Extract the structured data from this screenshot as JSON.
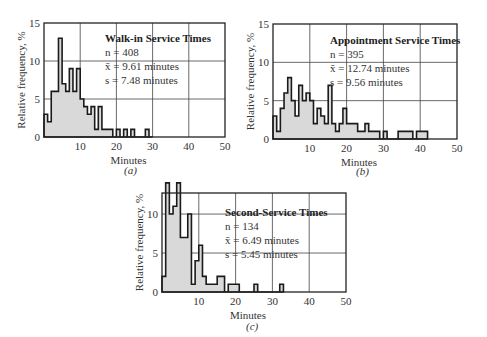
{
  "chart_data": [
    {
      "id": "a",
      "type": "bar",
      "subtype": "histogram",
      "caption": "(a)",
      "title": "Walk-in Service Times",
      "stats": {
        "n_label": "n = 408",
        "mean_label": "x̄ = 9.61 minutes",
        "sd_label": "s = 7.48 minutes"
      },
      "xlabel": "Minutes",
      "ylabel": "Relative frequency, %",
      "xlim": [
        0,
        50
      ],
      "ylim": [
        0,
        15
      ],
      "xticks": [
        10,
        20,
        30,
        40,
        50
      ],
      "yticks": [
        0,
        5,
        10,
        15
      ],
      "grid": true,
      "bin_width": 1,
      "values": [
        3,
        2,
        6,
        6,
        13,
        7,
        6,
        9,
        6,
        9,
        5,
        4,
        3,
        4,
        1,
        4,
        1,
        1,
        1,
        0,
        1,
        0,
        1,
        0,
        1,
        0,
        0,
        0,
        1,
        0
      ]
    },
    {
      "id": "b",
      "type": "bar",
      "subtype": "histogram",
      "caption": "(b)",
      "title": "Appointment Service Times",
      "stats": {
        "n_label": "n = 395",
        "mean_label": "x̄ = 12.74 minutes",
        "sd_label": "s = 9.56 minutes"
      },
      "xlabel": "Minutes",
      "ylabel": "Relative frequency, %",
      "xlim": [
        0,
        50
      ],
      "ylim": [
        0,
        15
      ],
      "xticks": [
        10,
        20,
        30,
        40,
        50
      ],
      "yticks": [
        0,
        5,
        10,
        15
      ],
      "grid": true,
      "bin_width": 1,
      "values": [
        3,
        1,
        4,
        6,
        8,
        5,
        3,
        7,
        5,
        6,
        5,
        2,
        4,
        3,
        2,
        7,
        2,
        1,
        2,
        4,
        2,
        2,
        2,
        1,
        1,
        2,
        1,
        1,
        1,
        0,
        1,
        0,
        0,
        0,
        1,
        1,
        1,
        1,
        0,
        1,
        1,
        1
      ]
    },
    {
      "id": "c",
      "type": "bar",
      "subtype": "histogram",
      "caption": "(c)",
      "title": "Second-Service Times",
      "stats": {
        "n_label": "n = 134",
        "mean_label": "x̄ = 6.49 minutes",
        "sd_label": "s = 5.45 minutes"
      },
      "xlabel": "Minutes",
      "ylabel": "Relative frequency, %",
      "xlim": [
        0,
        50
      ],
      "ylim": [
        0,
        12.7
      ],
      "xticks": [
        10,
        20,
        30,
        40,
        50
      ],
      "yticks": [
        0,
        5,
        10
      ],
      "grid": true,
      "bin_width": 1,
      "values": [
        2,
        14,
        10,
        11,
        14,
        7,
        7,
        10,
        1,
        4,
        6,
        2,
        1,
        1,
        1,
        2,
        2,
        0,
        1,
        1,
        1,
        0,
        0,
        0,
        0,
        1,
        0,
        0,
        0,
        0,
        0,
        0,
        1
      ]
    }
  ],
  "colors": {
    "fill": "#d9d9d9",
    "line": "#1a1a1a",
    "grid": "#444444",
    "frame": "#222222"
  }
}
